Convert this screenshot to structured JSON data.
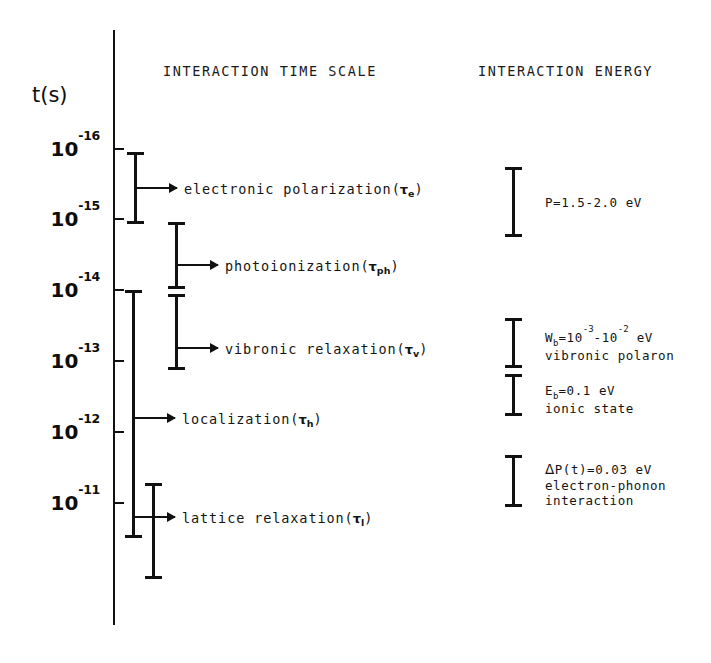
{
  "figure": {
    "axis_title": "t(s)",
    "headers": {
      "time_scale": "INTERACTION TIME SCALE",
      "energy": "INTERACTION ENERGY"
    },
    "axis_ticks": [
      {
        "label_mantissa": "10",
        "label_exponent": "-16",
        "value": -16
      },
      {
        "label_mantissa": "10",
        "label_exponent": "-15",
        "value": -15
      },
      {
        "label_mantissa": "10",
        "label_exponent": "-14",
        "value": -14
      },
      {
        "label_mantissa": "10",
        "label_exponent": "-13",
        "value": -13
      },
      {
        "label_mantissa": "10",
        "label_exponent": "-12",
        "value": -12
      },
      {
        "label_mantissa": "10",
        "label_exponent": "-11",
        "value": -11
      }
    ],
    "processes": [
      {
        "name": "electronic polarization",
        "symbol_prefix": "(",
        "symbol_tau": "τ",
        "symbol_sub": "e",
        "symbol_suffix": ")",
        "range_log10_s": [
          -16.05,
          -15.0
        ]
      },
      {
        "name": "photoionization",
        "symbol_prefix": "(",
        "symbol_tau": "τ",
        "symbol_sub": "ph",
        "symbol_suffix": ")",
        "range_log10_s": [
          -15.05,
          -14.1
        ]
      },
      {
        "name": "vibronic relaxation",
        "symbol_prefix": "(",
        "symbol_tau": "τ",
        "symbol_sub": "v",
        "symbol_suffix": ")",
        "range_log10_s": [
          -14.05,
          -13.0
        ]
      },
      {
        "name": "localization",
        "symbol_prefix": "(",
        "symbol_tau": "τ",
        "symbol_sub": "h",
        "symbol_suffix": ")",
        "range_log10_s": [
          -14.05,
          -11.5
        ]
      },
      {
        "name": "lattice relaxation",
        "symbol_prefix": "(",
        "symbol_tau": "τ",
        "symbol_sub": "l",
        "symbol_suffix": ")",
        "range_log10_s": [
          -12.2,
          -10.85
        ]
      }
    ],
    "energies": [
      {
        "line1_pre": "P=1.5-2.0 eV",
        "line2": "",
        "line3": ""
      },
      {
        "line1_pre": "W",
        "line1_sub": "b",
        "line1_post": "=10",
        "line1_sup1": "-3",
        "line1_mid": "-10",
        "line1_sup2": "-2",
        "line1_end": " eV",
        "line2": "vibronic polaron",
        "line3": ""
      },
      {
        "line1_pre": "E",
        "line1_sub": "b",
        "line1_post": "=0.1 eV",
        "line2": "ionic state",
        "line3": ""
      },
      {
        "line1_delta": "Δ",
        "line1_post": "P(t)=0.03 eV",
        "line2": "electron-phonon",
        "line3": "interaction"
      }
    ]
  }
}
